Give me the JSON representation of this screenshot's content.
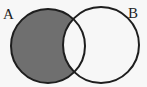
{
  "diagram": {
    "type": "venn",
    "sets": [
      {
        "name": "A",
        "label": "A",
        "shaded_region": "A only"
      },
      {
        "name": "B",
        "label": "B"
      }
    ],
    "shaded": "A minus B",
    "colors": {
      "shade": "#6f6f6f",
      "stroke": "#1e1e1e",
      "background": "#f7f7f7"
    }
  }
}
